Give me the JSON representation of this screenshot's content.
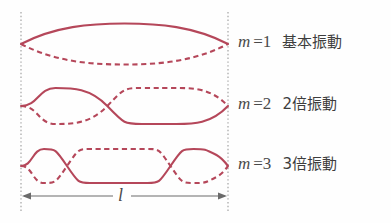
{
  "figure": {
    "background_color": "#fefefe",
    "wave_color": "#b5475a",
    "boundary_color": "#9a9a9a",
    "arrow_color": "#6b6b6b",
    "text_color": "#4a4a4a"
  },
  "boundaries": {
    "left_x": 21,
    "right_x": 228,
    "top_y": 12,
    "bottom_y": 212
  },
  "modes": [
    {
      "m_symbol": "m",
      "equals": "=1",
      "name_jp": "基本振動",
      "harmonic": 1,
      "half_wavelengths": 1,
      "axis_y": 44,
      "amplitude": 15,
      "label_x": 238,
      "label_y": 33
    },
    {
      "m_symbol": "m",
      "equals": "=2",
      "name_jp": "2倍振動",
      "harmonic": 2,
      "half_wavelengths": 2,
      "axis_y": 106,
      "amplitude": 18,
      "label_x": 238,
      "label_y": 95
    },
    {
      "m_symbol": "m",
      "equals": "=3",
      "name_jp": "3倍振動",
      "harmonic": 3,
      "half_wavelengths": 3,
      "axis_y": 166,
      "amplitude": 18,
      "label_x": 238,
      "label_y": 155
    }
  ],
  "dimension": {
    "symbol": "l",
    "arrow_y": 196,
    "label_x": 118,
    "label_y": 186,
    "start_x": 22,
    "end_x": 227
  }
}
